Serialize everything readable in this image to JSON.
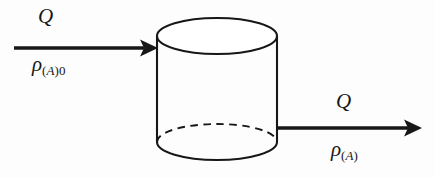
{
  "figure": {
    "kind": "process-flow-diagram",
    "background_color": "#fdfdfd",
    "stroke_color": "#171717"
  },
  "vessel": {
    "name": "cylindrical-tank",
    "shape": "cylinder",
    "top_face": "solid-ellipse",
    "bottom_front_edge": "solid-arc",
    "bottom_back_edge": "dashed-arc",
    "left_wall_x": 157,
    "right_wall_x": 277,
    "top_y": 18,
    "bottom_y": 160
  },
  "inlet": {
    "arrow_name": "inlet-flow-arrow",
    "direction": "right",
    "start_x": 14,
    "end_x": 158,
    "y": 48,
    "labels": {
      "flow_symbol": "Q",
      "density_symbol": "ρ",
      "density_subscript_open": "(",
      "density_subscript_species": "A",
      "density_subscript_close": ")",
      "density_subscript_stream": "0"
    }
  },
  "outlet": {
    "arrow_name": "outlet-flow-arrow",
    "direction": "right",
    "start_x": 277,
    "end_x": 422,
    "y": 128,
    "labels": {
      "flow_symbol": "Q",
      "density_symbol": "ρ",
      "density_subscript_open": "(",
      "density_subscript_species": "A",
      "density_subscript_close": ")"
    }
  }
}
